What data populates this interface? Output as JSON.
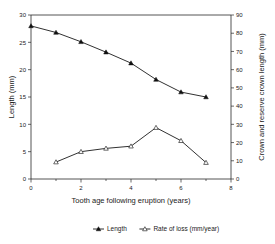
{
  "chart_data": {
    "type": "line",
    "title": "",
    "xlabel": "Tooth age following eruption (years)",
    "ylabel": "Length (mm)",
    "y2label": "Crown and reserve crown length (mm)",
    "xlim": [
      0,
      8
    ],
    "ylim": [
      0,
      30
    ],
    "y2lim": [
      0,
      90
    ],
    "xticks": [
      0,
      2,
      4,
      6,
      8
    ],
    "xtick_labels": [
      "0",
      "2",
      "4",
      "6",
      "8"
    ],
    "xminor_ticks": [
      1,
      3,
      5,
      7
    ],
    "yticks": [
      0,
      5,
      10,
      15,
      20,
      25,
      30
    ],
    "ytick_labels": [
      "0",
      "5",
      "10",
      "15",
      "20",
      "25",
      "30"
    ],
    "y2ticks": [
      0,
      10,
      20,
      30,
      40,
      50,
      60,
      70,
      80,
      90
    ],
    "y2tick_labels": [
      "0",
      "10",
      "20",
      "30",
      "40",
      "50",
      "60",
      "70",
      "80",
      "90"
    ],
    "grid": false,
    "legend_position": "bottom",
    "series": [
      {
        "name": "Length",
        "axis": "left",
        "marker": "filled-triangle",
        "x": [
          0,
          1,
          2,
          3,
          4,
          5,
          6,
          7
        ],
        "values": [
          28.0,
          26.8,
          25.1,
          23.2,
          21.2,
          18.2,
          15.9,
          15.0
        ]
      },
      {
        "name": "Rate of loss (mm/year)",
        "axis": "left",
        "marker": "open-triangle",
        "x": [
          1,
          2,
          3,
          4,
          5,
          6,
          7
        ],
        "values": [
          3.1,
          5.0,
          5.6,
          6.0,
          9.4,
          7.0,
          3.0
        ]
      }
    ]
  },
  "legend": {
    "entries": [
      {
        "label": "Length",
        "marker": "filled-triangle"
      },
      {
        "label": "Rate of loss (mm/year)",
        "marker": "open-triangle"
      }
    ]
  },
  "colors": {
    "line": "#1a1a1a",
    "axis": "#2a2a2a",
    "background": "#ffffff",
    "text": "#1a1a1a"
  }
}
